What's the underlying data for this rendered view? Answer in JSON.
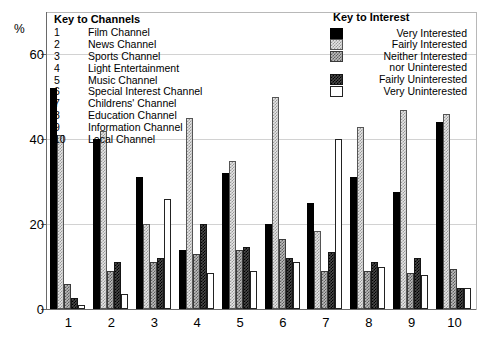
{
  "chart_data": {
    "type": "bar",
    "title": "",
    "xlabel": "",
    "ylabel": "%",
    "ylim": [
      0,
      70
    ],
    "yticks": [
      0,
      20,
      40,
      60
    ],
    "grid": true,
    "legend_position": "top-right",
    "categories": [
      "1",
      "2",
      "3",
      "4",
      "5",
      "6",
      "7",
      "8",
      "9",
      "10"
    ],
    "category_names": [
      "Film Channel",
      "News Channel",
      "Sports Channel",
      "Light Entertainment",
      "Music Channel",
      "Special Interest Channel",
      "Childrens' Channel",
      "Education Channel",
      "Information Channel",
      "Local Channel"
    ],
    "series": [
      {
        "name": "Very Interested",
        "pattern": "solid-black",
        "values": [
          52,
          40,
          31,
          14,
          32,
          20,
          25,
          31,
          27.5,
          44
        ]
      },
      {
        "name": "Fairly Interested",
        "pattern": "light-dotted",
        "values": [
          41,
          42,
          20,
          45,
          35,
          50,
          18.5,
          43,
          47,
          46
        ]
      },
      {
        "name": "Neither Interested nor Uninterested",
        "pattern": "mid-checker",
        "values": [
          6,
          9,
          11,
          13,
          14,
          16.5,
          9,
          9,
          8.5,
          9.5
        ]
      },
      {
        "name": "Fairly Uninterested",
        "pattern": "dark-checker",
        "values": [
          2.5,
          11,
          12,
          20,
          14.5,
          12,
          13.5,
          11,
          12,
          5
        ]
      },
      {
        "name": "Very Uninterested",
        "pattern": "white",
        "values": [
          1,
          3.5,
          26,
          8.5,
          9,
          11,
          40,
          10,
          8,
          5
        ]
      }
    ]
  },
  "key_channels": {
    "title": "Key to Channels",
    "rows": [
      {
        "num": "1",
        "name": "Film Channel"
      },
      {
        "num": "2",
        "name": "News Channel"
      },
      {
        "num": "3",
        "name": "Sports Channel"
      },
      {
        "num": "4",
        "name": "Light Entertainment"
      },
      {
        "num": "5",
        "name": "Music Channel"
      },
      {
        "num": "6",
        "name": "Special Interest Channel"
      },
      {
        "num": "7",
        "name": "Childrens' Channel"
      },
      {
        "num": "8",
        "name": "Education Channel"
      },
      {
        "num": "9",
        "name": "Information Channel"
      },
      {
        "num": "10",
        "name": "Local Channel"
      }
    ]
  },
  "key_interest": {
    "title": "Key to Interest",
    "rows": [
      {
        "label": "Very Interested",
        "swatch": "solid-black"
      },
      {
        "label": "Fairly Interested",
        "swatch": "light-dotted"
      },
      {
        "label": "Neither Interested",
        "swatch": "mid-checker"
      },
      {
        "label": "nor Uninterested",
        "swatch": "none"
      },
      {
        "label": "Fairly Uninterested",
        "swatch": "dark-checker"
      },
      {
        "label": "Very Uninterested",
        "swatch": "white"
      }
    ]
  },
  "colors": {
    "axis": "#6a6a6a",
    "grid": "#d2d2d2",
    "series_solid": "#000000",
    "series_white": "#ffffff"
  }
}
